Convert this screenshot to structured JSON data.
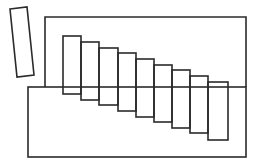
{
  "diagram": {
    "title": "",
    "stroke_color": "#2a2a2a",
    "background": "#ffffff",
    "tilted_rect": {
      "points": [
        [
          10,
          9
        ],
        [
          27,
          7
        ],
        [
          34,
          75
        ],
        [
          17,
          77
        ]
      ]
    },
    "back_rect": {
      "x1": 45,
      "y1": 17,
      "x2": 246
    },
    "front_rect": {
      "x": 28,
      "y": 87,
      "x2": 246,
      "y2": 157
    },
    "bars": [
      {
        "x": 63,
        "y": 36,
        "w": 18,
        "h": 58
      },
      {
        "x": 81,
        "y": 42,
        "w": 18,
        "h": 58
      },
      {
        "x": 99,
        "y": 48,
        "w": 19,
        "h": 57
      },
      {
        "x": 118,
        "y": 53,
        "w": 18,
        "h": 58
      },
      {
        "x": 136,
        "y": 59,
        "w": 18,
        "h": 58
      },
      {
        "x": 154,
        "y": 65,
        "w": 18,
        "h": 57
      },
      {
        "x": 172,
        "y": 70,
        "w": 18,
        "h": 58
      },
      {
        "x": 190,
        "y": 76,
        "w": 18,
        "h": 57
      },
      {
        "x": 208,
        "y": 82,
        "w": 20,
        "h": 58
      }
    ]
  }
}
